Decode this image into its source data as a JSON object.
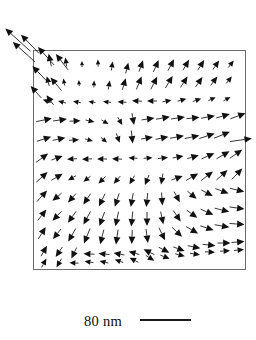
{
  "figure": {
    "kind": "vector-field-map",
    "background_color": "#ffffff",
    "arrow_color": "#111111",
    "frame_color": "#6d6d6d"
  },
  "frame": {
    "x": 33,
    "y": 50,
    "width": 212,
    "height": 219,
    "stroke_width": 1
  },
  "scale_bar": {
    "label": "80 nm",
    "label_x": 84,
    "label_y": 312,
    "bar_x1": 140,
    "bar_x2": 191,
    "bar_y": 320,
    "bar_color": "#1a1a1a",
    "bar_thickness": 1.9
  },
  "chart_data": {
    "type": "scatter",
    "title": "",
    "xlabel": "",
    "ylabel": "",
    "grid": false,
    "legend": null,
    "xlim": [
      33,
      245
    ],
    "ylim": [
      50,
      269
    ],
    "note": "Quiver field: each datum is x, y (px), direction angle in degrees measured clockwise from +x axis in screen coords, and arrow length in px",
    "columns": [
      "x",
      "y",
      "angle_deg",
      "length"
    ],
    "vectors": [
      [
        18,
        40,
        222,
        34
      ],
      [
        24,
        52,
        222,
        30
      ],
      [
        30,
        44,
        226,
        26
      ],
      [
        46,
        56,
        228,
        24
      ],
      [
        40,
        74,
        226,
        22
      ],
      [
        36,
        92,
        228,
        16
      ],
      [
        62,
        62,
        232,
        20
      ],
      [
        56,
        84,
        230,
        17
      ],
      [
        50,
        100,
        234,
        12
      ],
      [
        50,
        60,
        258,
        13
      ],
      [
        66,
        62,
        262,
        9
      ],
      [
        82,
        64,
        270,
        6
      ],
      [
        98,
        63,
        268,
        7
      ],
      [
        112,
        66,
        278,
        9
      ],
      [
        127,
        68,
        284,
        11
      ],
      [
        141,
        66,
        290,
        12
      ],
      [
        156,
        66,
        294,
        13
      ],
      [
        171,
        65,
        298,
        13
      ],
      [
        186,
        65,
        300,
        12
      ],
      [
        201,
        65,
        302,
        12
      ],
      [
        216,
        65,
        305,
        11
      ],
      [
        231,
        64,
        308,
        9
      ],
      [
        48,
        81,
        256,
        10
      ],
      [
        64,
        82,
        260,
        7
      ],
      [
        79,
        83,
        266,
        6
      ],
      [
        94,
        84,
        272,
        7
      ],
      [
        109,
        85,
        280,
        9
      ],
      [
        124,
        84,
        286,
        12
      ],
      [
        139,
        83,
        292,
        14
      ],
      [
        154,
        83,
        297,
        14
      ],
      [
        169,
        82,
        301,
        14
      ],
      [
        184,
        82,
        303,
        13
      ],
      [
        199,
        82,
        305,
        12
      ],
      [
        214,
        81,
        307,
        11
      ],
      [
        229,
        80,
        309,
        9
      ],
      [
        47,
        101,
        200,
        9
      ],
      [
        62,
        102,
        196,
        8
      ],
      [
        77,
        102,
        192,
        8
      ],
      [
        92,
        102,
        188,
        7
      ],
      [
        107,
        102,
        186,
        8
      ],
      [
        122,
        102,
        184,
        9
      ],
      [
        137,
        101,
        182,
        10
      ],
      [
        152,
        101,
        180,
        10
      ],
      [
        167,
        101,
        350,
        9
      ],
      [
        182,
        100,
        345,
        9
      ],
      [
        197,
        100,
        340,
        9
      ],
      [
        212,
        99,
        336,
        8
      ],
      [
        227,
        99,
        332,
        8
      ],
      [
        44,
        120,
        348,
        16
      ],
      [
        60,
        120,
        352,
        14
      ],
      [
        75,
        121,
        358,
        11
      ],
      [
        90,
        121,
        12,
        9
      ],
      [
        105,
        122,
        30,
        8
      ],
      [
        120,
        121,
        60,
        9
      ],
      [
        133,
        119,
        80,
        12
      ],
      [
        148,
        119,
        352,
        13
      ],
      [
        163,
        118,
        350,
        14
      ],
      [
        178,
        118,
        352,
        14
      ],
      [
        193,
        118,
        354,
        13
      ],
      [
        208,
        117,
        350,
        14
      ],
      [
        223,
        116,
        344,
        14
      ],
      [
        238,
        116,
        340,
        16
      ],
      [
        44,
        139,
        342,
        15
      ],
      [
        59,
        139,
        348,
        13
      ],
      [
        74,
        140,
        356,
        10
      ],
      [
        89,
        140,
        14,
        8
      ],
      [
        104,
        140,
        40,
        8
      ],
      [
        118,
        138,
        70,
        10
      ],
      [
        132,
        137,
        84,
        13
      ],
      [
        147,
        138,
        350,
        12
      ],
      [
        162,
        138,
        348,
        13
      ],
      [
        177,
        137,
        350,
        14
      ],
      [
        192,
        137,
        348,
        15
      ],
      [
        207,
        136,
        342,
        16
      ],
      [
        222,
        135,
        338,
        17
      ],
      [
        241,
        140,
        352,
        22
      ],
      [
        42,
        158,
        324,
        15
      ],
      [
        57,
        158,
        340,
        12
      ],
      [
        72,
        159,
        176,
        10
      ],
      [
        87,
        159,
        178,
        10
      ],
      [
        102,
        159,
        180,
        10
      ],
      [
        117,
        159,
        182,
        10
      ],
      [
        133,
        158,
        184,
        9
      ],
      [
        148,
        158,
        356,
        9
      ],
      [
        163,
        158,
        354,
        10
      ],
      [
        178,
        157,
        350,
        11
      ],
      [
        193,
        157,
        344,
        12
      ],
      [
        208,
        156,
        336,
        14
      ],
      [
        223,
        155,
        330,
        15
      ],
      [
        236,
        154,
        326,
        15
      ],
      [
        42,
        177,
        318,
        15
      ],
      [
        57,
        177,
        330,
        13
      ],
      [
        72,
        178,
        150,
        9
      ],
      [
        87,
        179,
        142,
        9
      ],
      [
        102,
        180,
        136,
        10
      ],
      [
        117,
        180,
        130,
        10
      ],
      [
        132,
        180,
        120,
        10
      ],
      [
        147,
        180,
        112,
        11
      ],
      [
        162,
        179,
        100,
        11
      ],
      [
        177,
        178,
        340,
        12
      ],
      [
        192,
        177,
        330,
        14
      ],
      [
        207,
        176,
        322,
        15
      ],
      [
        222,
        175,
        318,
        15
      ],
      [
        237,
        174,
        314,
        15
      ],
      [
        42,
        196,
        312,
        15
      ],
      [
        57,
        197,
        140,
        12
      ],
      [
        72,
        198,
        132,
        12
      ],
      [
        87,
        199,
        124,
        13
      ],
      [
        102,
        200,
        116,
        14
      ],
      [
        117,
        200,
        108,
        14
      ],
      [
        132,
        200,
        100,
        14
      ],
      [
        147,
        200,
        96,
        14
      ],
      [
        162,
        199,
        86,
        13
      ],
      [
        177,
        197,
        62,
        12
      ],
      [
        192,
        195,
        40,
        12
      ],
      [
        207,
        193,
        28,
        13
      ],
      [
        222,
        191,
        20,
        14
      ],
      [
        237,
        190,
        14,
        15
      ],
      [
        42,
        215,
        308,
        14
      ],
      [
        57,
        216,
        134,
        13
      ],
      [
        72,
        217,
        126,
        14
      ],
      [
        87,
        218,
        118,
        15
      ],
      [
        102,
        219,
        110,
        15
      ],
      [
        117,
        219,
        102,
        15
      ],
      [
        132,
        219,
        96,
        15
      ],
      [
        147,
        219,
        90,
        14
      ],
      [
        162,
        218,
        78,
        13
      ],
      [
        177,
        216,
        56,
        13
      ],
      [
        192,
        214,
        36,
        13
      ],
      [
        207,
        212,
        24,
        14
      ],
      [
        222,
        210,
        14,
        15
      ],
      [
        237,
        208,
        8,
        15
      ],
      [
        42,
        233,
        302,
        14
      ],
      [
        57,
        234,
        128,
        13
      ],
      [
        72,
        235,
        120,
        15
      ],
      [
        87,
        236,
        112,
        16
      ],
      [
        102,
        237,
        104,
        15
      ],
      [
        117,
        237,
        98,
        15
      ],
      [
        132,
        237,
        92,
        14
      ],
      [
        147,
        236,
        82,
        14
      ],
      [
        162,
        234,
        64,
        14
      ],
      [
        177,
        232,
        44,
        14
      ],
      [
        192,
        230,
        30,
        14
      ],
      [
        207,
        228,
        18,
        14
      ],
      [
        222,
        226,
        10,
        15
      ],
      [
        237,
        224,
        4,
        15
      ],
      [
        44,
        251,
        300,
        12
      ],
      [
        59,
        252,
        124,
        12
      ],
      [
        74,
        253,
        116,
        12
      ],
      [
        89,
        254,
        182,
        11
      ],
      [
        104,
        254,
        186,
        11
      ],
      [
        119,
        254,
        190,
        11
      ],
      [
        134,
        253,
        196,
        11
      ],
      [
        149,
        252,
        206,
        12
      ],
      [
        164,
        250,
        28,
        12
      ],
      [
        179,
        249,
        20,
        12
      ],
      [
        194,
        247,
        12,
        13
      ],
      [
        209,
        245,
        6,
        13
      ],
      [
        224,
        243,
        0,
        13
      ],
      [
        238,
        242,
        356,
        13
      ],
      [
        44,
        263,
        298,
        10
      ],
      [
        59,
        263,
        120,
        10
      ],
      [
        74,
        263,
        182,
        9
      ],
      [
        89,
        262,
        188,
        9
      ],
      [
        104,
        262,
        194,
        9
      ],
      [
        119,
        261,
        200,
        9
      ],
      [
        134,
        260,
        208,
        10
      ],
      [
        150,
        258,
        32,
        10
      ],
      [
        165,
        257,
        22,
        10
      ],
      [
        180,
        255,
        14,
        10
      ],
      [
        195,
        254,
        8,
        10
      ],
      [
        210,
        252,
        2,
        10
      ],
      [
        225,
        251,
        358,
        10
      ],
      [
        239,
        250,
        354,
        10
      ]
    ]
  }
}
